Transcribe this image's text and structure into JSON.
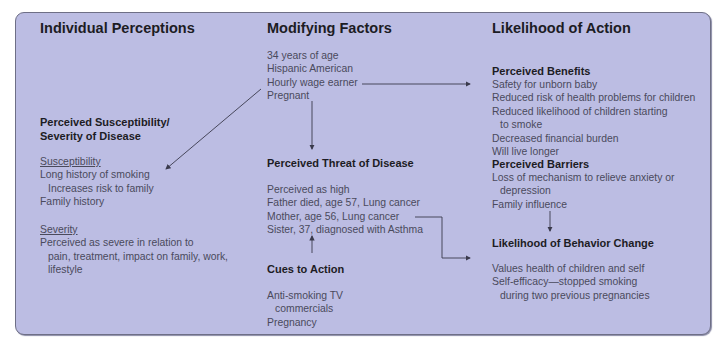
{
  "columns": {
    "individual_perceptions": {
      "title": "Individual Perceptions",
      "section_title_1": "Perceived Susceptibility/",
      "section_title_2": "Severity of Disease",
      "susceptibility_label": "Susceptibility",
      "susceptibility_items": [
        "Long history of smoking",
        "Increases risk to family",
        "Family history"
      ],
      "severity_label": "Severity",
      "severity_items": [
        "Perceived as severe in relation to",
        "pain, treatment, impact on family, work,",
        "lifestyle"
      ]
    },
    "modifying_factors": {
      "title": "Modifying Factors",
      "demographics": [
        "34 years of age",
        "Hispanic American",
        "Hourly wage earner",
        "Pregnant"
      ],
      "threat_title": "Perceived Threat of Disease",
      "threat_items": [
        "Perceived as high",
        "Father died, age 57, Lung cancer",
        "Mother, age 56, Lung cancer",
        "Sister, 37, diagnosed with Asthma"
      ],
      "cues_title": "Cues to Action",
      "cues_items": [
        "Anti-smoking TV",
        "commercials",
        "Pregnancy"
      ]
    },
    "likelihood_of_action": {
      "title": "Likelihood of Action",
      "benefits_title": "Perceived Benefits",
      "benefits_items": [
        "Safety for unborn baby",
        "Reduced risk of health problems for children",
        "Reduced likelihood of children starting",
        "to smoke",
        "Decreased financial burden",
        "Will live longer"
      ],
      "barriers_title": "Perceived Barriers",
      "barriers_items": [
        "Loss of mechanism to relieve anxiety or",
        "depression",
        "Family influence"
      ],
      "change_title": "Likelihood of Behavior Change",
      "change_items": [
        "Values health of children and self",
        "Self-efficacy—stopped  smoking",
        "during two previous pregnancies"
      ]
    }
  },
  "colors": {
    "panel_bg": "#bcbde3",
    "heading": "#1c1c24",
    "body_text": "#4a4a5c",
    "arrow": "#3a3a4c"
  }
}
